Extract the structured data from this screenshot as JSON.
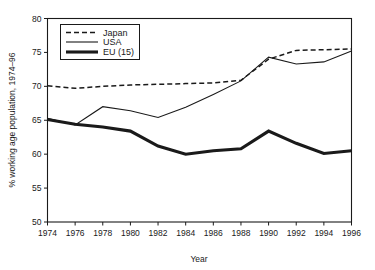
{
  "chart_data": {
    "type": "line",
    "title": "",
    "xlabel": "Year",
    "ylabel": "% working age population, 1974–96",
    "xlim": [
      1974,
      1996
    ],
    "ylim": [
      50,
      80
    ],
    "xticks": [
      1974,
      1976,
      1978,
      1980,
      1982,
      1984,
      1986,
      1988,
      1990,
      1992,
      1994,
      1996
    ],
    "yticks": [
      50,
      55,
      60,
      65,
      70,
      75,
      80
    ],
    "grid": false,
    "legend_position": "upper-left",
    "x": [
      1974,
      1976,
      1978,
      1980,
      1982,
      1984,
      1986,
      1988,
      1990,
      1992,
      1994,
      1996
    ],
    "series": [
      {
        "name": "Japan",
        "style": "dashed",
        "values": [
          70.1,
          69.7,
          70.0,
          70.2,
          70.3,
          70.4,
          70.5,
          70.9,
          74.0,
          75.3,
          75.4,
          75.5
        ]
      },
      {
        "name": "USA",
        "style": "solid-thin",
        "values": [
          65.3,
          64.3,
          67.0,
          66.4,
          65.4,
          66.9,
          68.8,
          70.8,
          74.3,
          73.3,
          73.6,
          75.2
        ]
      },
      {
        "name": "EU (15)",
        "style": "solid-thick",
        "values": [
          65.1,
          64.4,
          64.0,
          63.4,
          61.2,
          60.0,
          60.5,
          60.8,
          63.4,
          61.6,
          60.1,
          60.5
        ]
      }
    ]
  },
  "axes": {
    "y_title": "% working age population, 1974–96",
    "x_title": "Year",
    "y_tick_labels": [
      "80",
      "75",
      "70",
      "65",
      "60",
      "55",
      "50"
    ],
    "x_tick_labels": [
      "1974",
      "1976",
      "1978",
      "1980",
      "1982",
      "1984",
      "1986",
      "1988",
      "1990",
      "1992",
      "1994",
      "1996"
    ]
  },
  "legend": {
    "entries": [
      {
        "label": "Japan",
        "swatch": "dashed-line-swatch"
      },
      {
        "label": "USA",
        "swatch": "thin-line-swatch"
      },
      {
        "label": "EU (15)",
        "swatch": "thick-line-swatch"
      }
    ]
  },
  "colors": {
    "ink": "#1a1a1a",
    "background": "#ffffff"
  }
}
